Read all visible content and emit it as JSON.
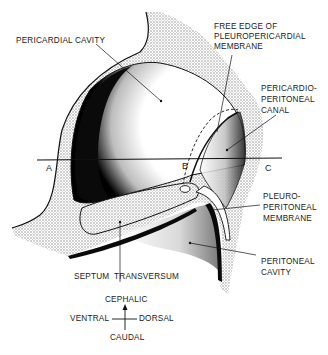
{
  "diagram": {
    "colors": {
      "ink": "#111111",
      "stipple": "#b8b8b8",
      "background": "#ffffff"
    },
    "labels": {
      "pericardial_cavity": "PERICARDIAL CAVITY",
      "free_edge_line1": "FREE EDGE OF",
      "free_edge_line2": "PLEUROPERICARDIAL",
      "free_edge_line3": "MEMBRANE",
      "pericardio_line1": "PERICARDIO-",
      "pericardio_line2": "PERITONEAL",
      "pericardio_line3": "CANAL",
      "pleuro_line1": "PLEURO-",
      "pleuro_line2": "PERITONEAL",
      "pleuro_line3": "MEMBRANE",
      "peritoneal_line1": "PERITONEAL",
      "peritoneal_line2": "CAVITY",
      "septum": "SEPTUM  TRANSVERSUM"
    },
    "section_points": [
      "A",
      "B",
      "C"
    ],
    "orientation": {
      "up": "CEPHALIC",
      "down": "CAUDAL",
      "left": "VENTRAL",
      "right": "DORSAL"
    }
  }
}
